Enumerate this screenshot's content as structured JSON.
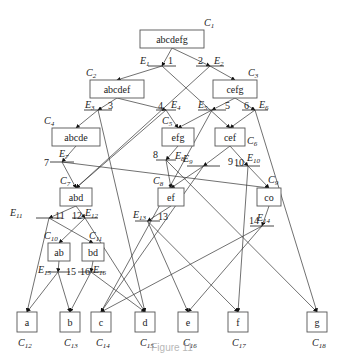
{
  "diagram": {
    "type": "reduction-graph",
    "nodes": [
      {
        "id": "C1",
        "label": "abcdefg",
        "x": 140,
        "y": 30,
        "w": 64,
        "h": 18
      },
      {
        "id": "C2",
        "label": "abcdef",
        "x": 90,
        "y": 80,
        "w": 54,
        "h": 18
      },
      {
        "id": "C3",
        "label": "cefg",
        "x": 213,
        "y": 80,
        "w": 44,
        "h": 18
      },
      {
        "id": "C4",
        "label": "abcde",
        "x": 52,
        "y": 128,
        "w": 48,
        "h": 18
      },
      {
        "id": "C5",
        "label": "efg",
        "x": 162,
        "y": 128,
        "w": 32,
        "h": 18
      },
      {
        "id": "C6",
        "label": "cef",
        "x": 215,
        "y": 128,
        "w": 30,
        "h": 18
      },
      {
        "id": "C7",
        "label": "abd",
        "x": 60,
        "y": 188,
        "w": 32,
        "h": 18
      },
      {
        "id": "C8",
        "label": "ef",
        "x": 158,
        "y": 188,
        "w": 26,
        "h": 18
      },
      {
        "id": "C9",
        "label": "co",
        "x": 257,
        "y": 188,
        "w": 24,
        "h": 18
      },
      {
        "id": "C10",
        "label": "ab",
        "x": 48,
        "y": 243,
        "w": 22,
        "h": 18
      },
      {
        "id": "C11",
        "label": "bd",
        "x": 82,
        "y": 243,
        "w": 22,
        "h": 18
      },
      {
        "id": "C12",
        "label": "a",
        "x": 17,
        "y": 312,
        "w": 20,
        "h": 20
      },
      {
        "id": "C13",
        "label": "b",
        "x": 60,
        "y": 312,
        "w": 20,
        "h": 20
      },
      {
        "id": "C14",
        "label": "c",
        "x": 91,
        "y": 312,
        "w": 20,
        "h": 20
      },
      {
        "id": "C15",
        "label": "d",
        "x": 135,
        "y": 312,
        "w": 20,
        "h": 20
      },
      {
        "id": "C16",
        "label": "e",
        "x": 178,
        "y": 312,
        "w": 20,
        "h": 20
      },
      {
        "id": "C17",
        "label": "f",
        "x": 228,
        "y": 312,
        "w": 20,
        "h": 20
      },
      {
        "id": "C18",
        "label": "g",
        "x": 307,
        "y": 312,
        "w": 20,
        "h": 20
      }
    ],
    "node_labels": [
      {
        "text": "C",
        "sub": "1",
        "x": 204,
        "y": 26
      },
      {
        "text": "C",
        "sub": "2",
        "x": 86,
        "y": 76
      },
      {
        "text": "C",
        "sub": "3",
        "x": 248,
        "y": 76
      },
      {
        "text": "C",
        "sub": "4",
        "x": 44,
        "y": 124
      },
      {
        "text": "C",
        "sub": "5",
        "x": 162,
        "y": 124
      },
      {
        "text": "C",
        "sub": "6",
        "x": 247,
        "y": 144
      },
      {
        "text": "C",
        "sub": "7",
        "x": 60,
        "y": 184
      },
      {
        "text": "C",
        "sub": "8",
        "x": 153,
        "y": 184
      },
      {
        "text": "C",
        "sub": "9",
        "x": 268,
        "y": 183
      },
      {
        "text": "C",
        "sub": "10",
        "x": 44,
        "y": 239
      },
      {
        "text": "C",
        "sub": "11",
        "x": 89,
        "y": 239
      },
      {
        "text": "C",
        "sub": "12",
        "x": 18,
        "y": 346
      },
      {
        "text": "C",
        "sub": "13",
        "x": 64,
        "y": 346
      },
      {
        "text": "C",
        "sub": "14",
        "x": 96,
        "y": 346
      },
      {
        "text": "C",
        "sub": "15",
        "x": 140,
        "y": 346
      },
      {
        "text": "C",
        "sub": "16",
        "x": 183,
        "y": 346
      },
      {
        "text": "C",
        "sub": "17",
        "x": 232,
        "y": 346
      },
      {
        "text": "C",
        "sub": "18",
        "x": 312,
        "y": 346
      }
    ],
    "edges": [
      {
        "id": "E1",
        "num": "1",
        "bar": [
          148,
          66,
          176,
          66
        ],
        "lbl": [
          140,
          64
        ],
        "numpos": [
          168,
          64
        ]
      },
      {
        "id": "E2",
        "num": "2",
        "bar": [
          196,
          66,
          224,
          66
        ],
        "lbl": [
          214,
          64
        ],
        "numpos": [
          198,
          64
        ]
      },
      {
        "id": "E3",
        "num": "3",
        "bar": [
          84,
          110,
          112,
          110
        ],
        "lbl": [
          85,
          108
        ],
        "numpos": [
          108,
          109
        ]
      },
      {
        "id": "E4",
        "num": "4",
        "bar": [
          156,
          110,
          176,
          110
        ],
        "lbl": [
          171,
          108
        ],
        "numpos": [
          158,
          109
        ]
      },
      {
        "id": "E5",
        "num": "5",
        "bar": [
          198,
          110,
          226,
          110
        ],
        "lbl": [
          198,
          108
        ],
        "numpos": [
          225,
          109
        ]
      },
      {
        "id": "E6",
        "num": "6",
        "bar": [
          242,
          110,
          268,
          110
        ],
        "lbl": [
          259,
          108
        ],
        "numpos": [
          244,
          109
        ]
      },
      {
        "id": "E7",
        "num": "7",
        "bar": [
          50,
          162,
          74,
          162
        ],
        "lbl": [
          59,
          157
        ],
        "numpos": [
          44,
          166
        ]
      },
      {
        "id": "E8",
        "num": "8",
        "bar": [
          156,
          160,
          176,
          160
        ],
        "lbl": [
          175,
          159
        ],
        "numpos": [
          153,
          158
        ]
      },
      {
        "id": "E9",
        "num": "9",
        "bar": [
          187,
          166,
          220,
          166
        ],
        "lbl": [
          183,
          162
        ],
        "numpos": [
          228,
          165
        ]
      },
      {
        "id": "E10",
        "num": "10",
        "bar": [
          236,
          166,
          260,
          166
        ],
        "lbl": [
          247,
          161
        ],
        "numpos": [
          234,
          166
        ]
      },
      {
        "id": "E11",
        "num": "11",
        "bar": [
          36,
          218,
          62,
          218
        ],
        "lbl": [
          10,
          216
        ],
        "numpos": [
          55,
          219
        ]
      },
      {
        "id": "E12",
        "num": "12",
        "bar": [
          72,
          218,
          98,
          218
        ],
        "lbl": [
          85,
          216
        ],
        "numpos": [
          72,
          219
        ]
      },
      {
        "id": "E13",
        "num": "13",
        "bar": [
          135,
          221,
          160,
          221
        ],
        "lbl": [
          133,
          218
        ],
        "numpos": [
          158,
          220
        ]
      },
      {
        "id": "E14",
        "num": "14",
        "bar": [
          250,
          226,
          274,
          226
        ],
        "lbl": [
          257,
          221
        ],
        "numpos": [
          249,
          224
        ]
      },
      {
        "id": "E15",
        "num": "15",
        "bar": [
          46,
          272,
          70,
          272
        ],
        "lbl": [
          38,
          273
        ],
        "numpos": [
          66,
          275
        ]
      },
      {
        "id": "E16",
        "num": "16",
        "bar": [
          78,
          272,
          104,
          272
        ],
        "lbl": [
          93,
          273
        ],
        "numpos": [
          80,
          275
        ]
      }
    ],
    "connections": [
      [
        "C1",
        "E1"
      ],
      [
        "C1",
        "E2"
      ],
      [
        "E1",
        "C2"
      ],
      [
        "E1",
        "C6"
      ],
      [
        "E2",
        "C3"
      ],
      [
        "E2",
        "C7"
      ],
      [
        "C2",
        "E3"
      ],
      [
        "C2",
        "E4"
      ],
      [
        "E3",
        "C4"
      ],
      [
        "E3",
        "C15"
      ],
      [
        "E4",
        "C5"
      ],
      [
        "E4",
        "C7"
      ],
      [
        "C3",
        "E5"
      ],
      [
        "C3",
        "E6"
      ],
      [
        "E5",
        "C5"
      ],
      [
        "E5",
        "C14"
      ],
      [
        "E6",
        "C6"
      ],
      [
        "E6",
        "C18"
      ],
      [
        "C4",
        "E7"
      ],
      [
        "E7",
        "C7"
      ],
      [
        "E7",
        "C9"
      ],
      [
        "C5",
        "E8"
      ],
      [
        "E8",
        "C8"
      ],
      [
        "E8",
        "C18"
      ],
      [
        "C6",
        "E9"
      ],
      [
        "C6",
        "E10"
      ],
      [
        "E9",
        "C8"
      ],
      [
        "E9",
        "C14"
      ],
      [
        "E10",
        "C9"
      ],
      [
        "E10",
        "C17"
      ],
      [
        "C7",
        "E11"
      ],
      [
        "C7",
        "E12"
      ],
      [
        "E11",
        "C12"
      ],
      [
        "E11",
        "C11"
      ],
      [
        "E12",
        "C10"
      ],
      [
        "E12",
        "C15"
      ],
      [
        "C8",
        "E13"
      ],
      [
        "E13",
        "C16"
      ],
      [
        "E13",
        "C17"
      ],
      [
        "C9",
        "E14"
      ],
      [
        "E14",
        "C14"
      ],
      [
        "E14",
        "C16"
      ],
      [
        "C10",
        "E15"
      ],
      [
        "E15",
        "C12"
      ],
      [
        "E15",
        "C13"
      ],
      [
        "C11",
        "E16"
      ],
      [
        "E16",
        "C13"
      ],
      [
        "E16",
        "C15"
      ]
    ],
    "caption": "Figure 11"
  }
}
